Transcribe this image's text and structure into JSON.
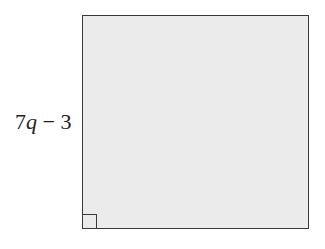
{
  "diagram": {
    "shape": "square",
    "side_label": {
      "coefficient": "7",
      "variable": "q",
      "operator": " − ",
      "constant": "3",
      "full_text": "7q − 3"
    },
    "right_angle_marker": "bottom-left",
    "colors": {
      "fill": "#ebebeb",
      "stroke": "#3a3a3a",
      "label": "#222222"
    }
  }
}
